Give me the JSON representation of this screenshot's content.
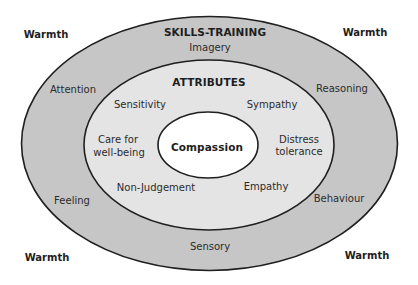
{
  "colors": {
    "background": "#ffffff",
    "outer_ring": "#c6c6c6",
    "middle_ring": "#e4e4e4",
    "inner_core": "#ffffff",
    "stroke": "#1f1f1f",
    "text": "#2b2b2b"
  },
  "corners": {
    "top_left": "Warmth",
    "top_right": "Warmth",
    "bottom_left": "Warmth",
    "bottom_right": "Warmth"
  },
  "outer_ring": {
    "title": "SKILLS-TRAINING",
    "items": {
      "imagery": "Imagery",
      "attention": "Attention",
      "reasoning": "Reasoning",
      "feeling": "Feeling",
      "behaviour": "Behaviour",
      "sensory": "Sensory"
    }
  },
  "middle_ring": {
    "title": "ATTRIBUTES",
    "items": {
      "sensitivity": "Sensitivity",
      "sympathy": "Sympathy",
      "care_line1": "Care for",
      "care_line2": "well-being",
      "distress_line1": "Distress",
      "distress_line2": "tolerance",
      "non_judgement": "Non-Judgement",
      "empathy": "Empathy"
    }
  },
  "core": {
    "label": "Compassion"
  }
}
